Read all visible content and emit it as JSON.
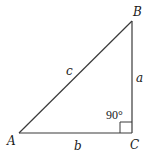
{
  "diagram": {
    "type": "right-triangle",
    "vertices": {
      "A": {
        "label": "A"
      },
      "B": {
        "label": "B"
      },
      "C": {
        "label": "C"
      }
    },
    "sides": {
      "hypotenuse": {
        "label": "c"
      },
      "vertical": {
        "label": "a"
      },
      "horizontal": {
        "label": "b"
      }
    },
    "right_angle": {
      "label": "90°",
      "vertex": "C"
    },
    "colors": {
      "stroke": "#3a3a3a",
      "text": "#1a1a1a",
      "background": "#ffffff"
    }
  }
}
